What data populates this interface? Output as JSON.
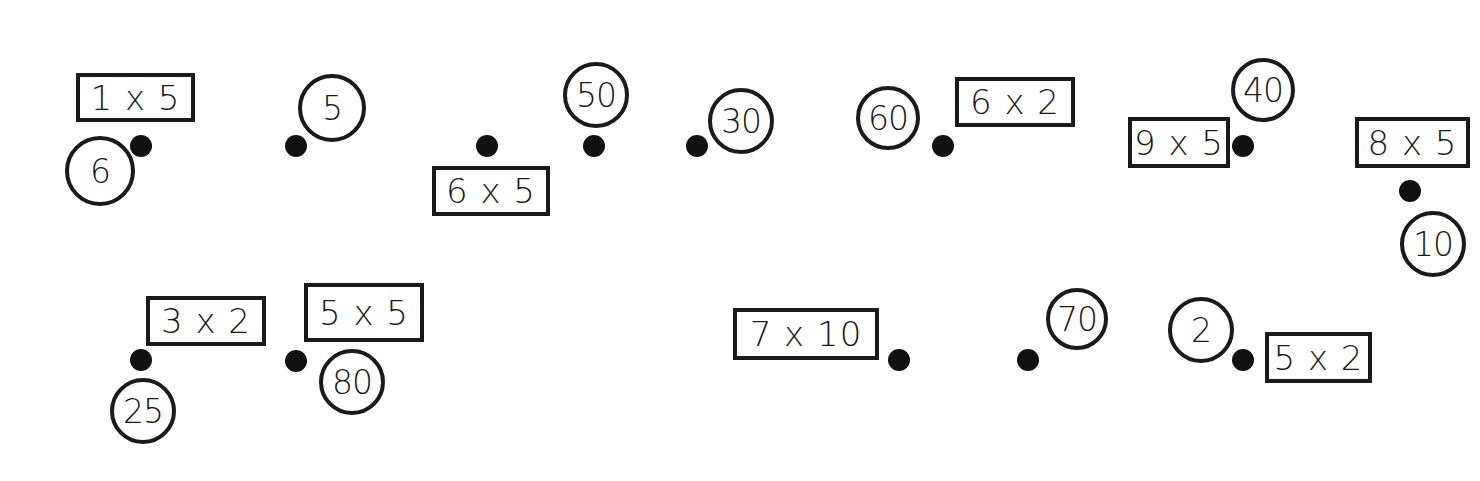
{
  "worksheet": {
    "type": "multiplication-matching",
    "colors": {
      "ink": "#1a1a1a",
      "dot": "#111111",
      "background": "#ffffff"
    },
    "expressions": [
      {
        "text": "1 x 5",
        "x": 76,
        "y": 73,
        "w": 119,
        "h": 49
      },
      {
        "text": "6 x 5",
        "x": 432,
        "y": 166,
        "w": 118,
        "h": 50
      },
      {
        "text": "6 x 2",
        "x": 955,
        "y": 77,
        "w": 120,
        "h": 50
      },
      {
        "text": "9 x 5",
        "x": 1128,
        "y": 117,
        "w": 102,
        "h": 51
      },
      {
        "text": "8 x 5",
        "x": 1355,
        "y": 117,
        "w": 115,
        "h": 51
      },
      {
        "text": "3 x 2",
        "x": 146,
        "y": 296,
        "w": 120,
        "h": 50
      },
      {
        "text": "5 x 5",
        "x": 304,
        "y": 283,
        "w": 120,
        "h": 59
      },
      {
        "text": "7 x 10",
        "x": 733,
        "y": 308,
        "w": 146,
        "h": 52
      },
      {
        "text": "5 x 2",
        "x": 1265,
        "y": 332,
        "w": 107,
        "h": 51
      }
    ],
    "answers": [
      {
        "text": "6",
        "cx": 100,
        "cy": 171,
        "d": 70
      },
      {
        "text": "5",
        "cx": 332,
        "cy": 108,
        "d": 68
      },
      {
        "text": "50",
        "cx": 596,
        "cy": 95,
        "d": 66
      },
      {
        "text": "30",
        "cx": 741,
        "cy": 121,
        "d": 66
      },
      {
        "text": "60",
        "cx": 888,
        "cy": 118,
        "d": 64
      },
      {
        "text": "40",
        "cx": 1263,
        "cy": 90,
        "d": 64
      },
      {
        "text": "10",
        "cx": 1433,
        "cy": 244,
        "d": 66
      },
      {
        "text": "25",
        "cx": 143,
        "cy": 411,
        "d": 66
      },
      {
        "text": "80",
        "cx": 352,
        "cy": 382,
        "d": 66
      },
      {
        "text": "70",
        "cx": 1077,
        "cy": 319,
        "d": 62
      },
      {
        "text": "2",
        "cx": 1201,
        "cy": 330,
        "d": 66
      }
    ],
    "dots": [
      {
        "cx": 141,
        "cy": 146
      },
      {
        "cx": 296,
        "cy": 146
      },
      {
        "cx": 487,
        "cy": 146
      },
      {
        "cx": 594,
        "cy": 146
      },
      {
        "cx": 697,
        "cy": 146
      },
      {
        "cx": 943,
        "cy": 146
      },
      {
        "cx": 1243,
        "cy": 146
      },
      {
        "cx": 1410,
        "cy": 191
      },
      {
        "cx": 141,
        "cy": 360
      },
      {
        "cx": 296,
        "cy": 361
      },
      {
        "cx": 899,
        "cy": 360
      },
      {
        "cx": 1028,
        "cy": 360
      },
      {
        "cx": 1243,
        "cy": 360
      }
    ]
  }
}
